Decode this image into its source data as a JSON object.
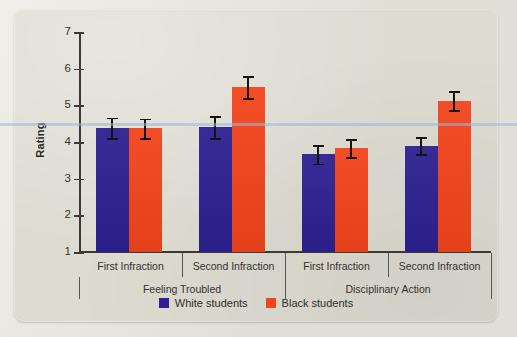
{
  "chart_data": {
    "type": "bar",
    "title": "",
    "xlabel": "",
    "ylabel": "Rating",
    "ylim": [
      1,
      7
    ],
    "yticks": [
      "1",
      "2",
      "3",
      "4",
      "5",
      "6",
      "7"
    ],
    "grid": false,
    "legend_position": "bottom-center",
    "categories": [
      "First Infraction",
      "Second Infraction",
      "First Infraction",
      "Second Infraction"
    ],
    "groups": [
      {
        "label": "Feeling Troubled",
        "categories": [
          "First Infraction",
          "Second Infraction"
        ]
      },
      {
        "label": "Disciplinary Action",
        "categories": [
          "First Infraction",
          "Second Infraction"
        ]
      }
    ],
    "series": [
      {
        "name": "White students",
        "color": "#2e2090",
        "values": [
          4.38,
          4.41,
          3.66,
          3.9
        ],
        "errors": [
          0.28,
          0.3,
          0.25,
          0.23
        ]
      },
      {
        "name": "Black students",
        "color": "#f2441c",
        "values": [
          4.37,
          5.5,
          3.83,
          5.13
        ],
        "errors": [
          0.27,
          0.3,
          0.25,
          0.26
        ]
      }
    ]
  },
  "axes": {
    "y_title": "Rating",
    "tick_labels": [
      "7",
      "6",
      "5",
      "4",
      "3",
      "2",
      "1"
    ]
  },
  "category_labels": [
    "First Infraction",
    "Second Infraction",
    "First Infraction",
    "Second Infraction"
  ],
  "group_labels": [
    "Feeling Troubled",
    "Disciplinary Action"
  ],
  "legend": {
    "items": [
      {
        "label": "White students",
        "color": "#2e2090",
        "icon": "square-swatch-navy"
      },
      {
        "label": "Black students",
        "color": "#f2441c",
        "icon": "square-swatch-red"
      }
    ]
  },
  "colors": {
    "white_students": "#2e2090",
    "black_students": "#f2441c",
    "card_background": "#dedbd1",
    "page_background": "#e9e6dd",
    "axis": "#3b3a36",
    "text": "#33312d",
    "scan_line": "#96b9dc"
  }
}
